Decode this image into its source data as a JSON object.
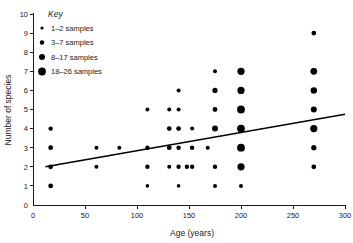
{
  "chart_data": {
    "type": "scatter",
    "title": "",
    "xlabel": "Age (years)",
    "ylabel": "Number of species",
    "xlim": [
      0,
      300
    ],
    "ylim": [
      0,
      10
    ],
    "xticks": [
      0,
      50,
      100,
      150,
      200,
      250,
      300
    ],
    "xtick_labels": [
      "0",
      "50",
      "100",
      "150",
      "200",
      "250",
      "300"
    ],
    "yticks": [
      0,
      1,
      2,
      3,
      4,
      5,
      6,
      7,
      8,
      9,
      10
    ],
    "ytick_labels": [
      "0",
      "1",
      "2",
      "3",
      "4",
      "5",
      "6",
      "7",
      "8",
      "9",
      "10"
    ],
    "grid": false,
    "legend_position": "top-left",
    "legend_title": "Key",
    "size_legend": [
      {
        "label": "1–2 samples",
        "radius": 1.6,
        "samples_min": 1,
        "samples_max": 2
      },
      {
        "label": "3–7 samples",
        "radius": 2.2,
        "samples_min": 3,
        "samples_max": 7
      },
      {
        "label": "8–17 samples",
        "radius": 3.0,
        "samples_min": 8,
        "samples_max": 17
      },
      {
        "label": "18–26 samples",
        "radius": 3.9,
        "samples_min": 18,
        "samples_max": 26
      }
    ],
    "points": [
      {
        "x": 17,
        "y": 4,
        "r": 2.2
      },
      {
        "x": 17,
        "y": 3,
        "r": 2.4
      },
      {
        "x": 17,
        "y": 2,
        "r": 2.4
      },
      {
        "x": 17,
        "y": 1,
        "r": 2.4
      },
      {
        "x": 61,
        "y": 3,
        "r": 2.0
      },
      {
        "x": 61,
        "y": 2,
        "r": 2.0
      },
      {
        "x": 83,
        "y": 3,
        "r": 2.0
      },
      {
        "x": 110,
        "y": 5,
        "r": 2.0
      },
      {
        "x": 110,
        "y": 3,
        "r": 2.2
      },
      {
        "x": 110,
        "y": 2,
        "r": 2.2
      },
      {
        "x": 110,
        "y": 1,
        "r": 1.8
      },
      {
        "x": 131,
        "y": 5,
        "r": 2.0
      },
      {
        "x": 131,
        "y": 4,
        "r": 2.4
      },
      {
        "x": 131,
        "y": 3,
        "r": 2.4
      },
      {
        "x": 131,
        "y": 2,
        "r": 2.0
      },
      {
        "x": 140,
        "y": 6,
        "r": 2.0
      },
      {
        "x": 140,
        "y": 5,
        "r": 2.0
      },
      {
        "x": 140,
        "y": 4,
        "r": 2.4
      },
      {
        "x": 140,
        "y": 3,
        "r": 2.2
      },
      {
        "x": 140,
        "y": 2,
        "r": 2.2
      },
      {
        "x": 140,
        "y": 1,
        "r": 1.8
      },
      {
        "x": 148,
        "y": 2,
        "r": 2.2
      },
      {
        "x": 153,
        "y": 4,
        "r": 2.0
      },
      {
        "x": 153,
        "y": 3,
        "r": 2.2
      },
      {
        "x": 153,
        "y": 2,
        "r": 2.2
      },
      {
        "x": 168,
        "y": 3,
        "r": 2.0
      },
      {
        "x": 175,
        "y": 7,
        "r": 2.0
      },
      {
        "x": 175,
        "y": 6,
        "r": 2.6
      },
      {
        "x": 175,
        "y": 5,
        "r": 2.4
      },
      {
        "x": 175,
        "y": 4,
        "r": 3.0
      },
      {
        "x": 175,
        "y": 2,
        "r": 2.2
      },
      {
        "x": 175,
        "y": 1,
        "r": 2.0
      },
      {
        "x": 200,
        "y": 7,
        "r": 3.6
      },
      {
        "x": 200,
        "y": 6,
        "r": 3.6
      },
      {
        "x": 200,
        "y": 5,
        "r": 3.9
      },
      {
        "x": 200,
        "y": 4,
        "r": 3.9
      },
      {
        "x": 200,
        "y": 3,
        "r": 3.9
      },
      {
        "x": 200,
        "y": 2,
        "r": 3.6
      },
      {
        "x": 200,
        "y": 1,
        "r": 2.0
      },
      {
        "x": 270,
        "y": 9,
        "r": 2.4
      },
      {
        "x": 270,
        "y": 7,
        "r": 3.4
      },
      {
        "x": 270,
        "y": 6,
        "r": 3.2
      },
      {
        "x": 270,
        "y": 5,
        "r": 3.0
      },
      {
        "x": 270,
        "y": 4,
        "r": 3.6
      },
      {
        "x": 270,
        "y": 3,
        "r": 2.6
      },
      {
        "x": 270,
        "y": 2,
        "r": 2.4
      }
    ],
    "trend_line": {
      "x_start": 12,
      "y_start": 2.0,
      "x_end": 300,
      "y_end": 4.75
    }
  },
  "colors": {
    "point": "#000000",
    "axis": "#1a1a1a",
    "trend": "#000000",
    "background": "#ffffff"
  }
}
